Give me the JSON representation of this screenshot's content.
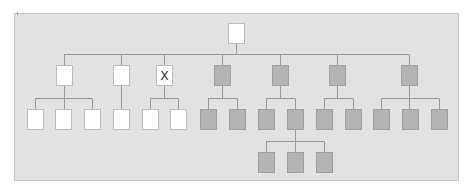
{
  "diagram": {
    "type": "tree",
    "colors": {
      "panel_bg": "#e2e2e2",
      "white_node": "#ffffff",
      "gray_node": "#b4b4b4",
      "connector": "#999999"
    },
    "root": {
      "id": "root",
      "label": "",
      "fill": "white"
    },
    "level1": [
      {
        "id": "a",
        "label": "",
        "fill": "white",
        "children": 3
      },
      {
        "id": "b",
        "label": "",
        "fill": "white",
        "children": 1
      },
      {
        "id": "c",
        "label": "X",
        "fill": "white",
        "children": 2
      },
      {
        "id": "d",
        "label": "",
        "fill": "gray",
        "children": 2
      },
      {
        "id": "e",
        "label": "",
        "fill": "gray",
        "children": 2
      },
      {
        "id": "f",
        "label": "",
        "fill": "gray",
        "children": 2
      },
      {
        "id": "g",
        "label": "",
        "fill": "gray",
        "children": 3
      }
    ],
    "level2_count": 15,
    "level3": {
      "parent": "e2",
      "count": 3,
      "fill": "gray"
    }
  }
}
